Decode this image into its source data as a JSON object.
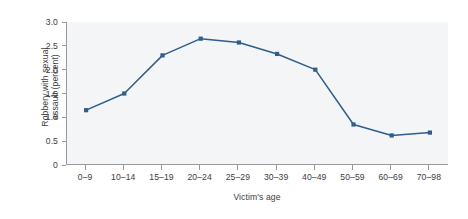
{
  "chart_data": {
    "type": "line",
    "title": "",
    "subtitle": "",
    "xlabel": "Victim's age",
    "ylabel": "Robbery with sexual assault (percent)",
    "ylabel_line1": "Robbery with sexual",
    "ylabel_line2": "assault (percent)",
    "categories": [
      "0–9",
      "10–14",
      "15–19",
      "20–24",
      "25–29",
      "30–39",
      "40–49",
      "50–59",
      "60–69",
      "70–98"
    ],
    "values": [
      1.15,
      1.5,
      2.3,
      2.65,
      2.57,
      2.33,
      2.0,
      0.85,
      0.62,
      0.68
    ],
    "ylim": [
      0,
      3.0
    ],
    "yticks": [
      0,
      0.5,
      1.0,
      1.5,
      2.0,
      2.5,
      3.0
    ],
    "ytick_labels": [
      "0",
      "0.5",
      "1.0",
      "1.5",
      "2.0",
      "2.5",
      "3.0"
    ],
    "grid": false,
    "legend": false,
    "legend_position": "none",
    "series": [
      {
        "name": "Robbery with sexual assault (percent)",
        "values": [
          1.15,
          1.5,
          2.3,
          2.65,
          2.57,
          2.33,
          2.0,
          0.85,
          0.62,
          0.68
        ]
      }
    ],
    "colors": {
      "line": "#2f5d8c",
      "marker": "#2f5d8c",
      "plot_background": "#f3f5f7",
      "figure_background": "#ffffff",
      "axis": "#9a9a9a",
      "text": "#3d3d3d"
    }
  }
}
